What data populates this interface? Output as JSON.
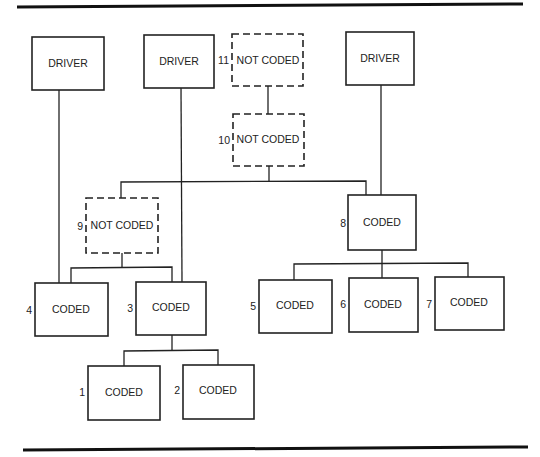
{
  "diagram": {
    "type": "tree",
    "nodes": [
      {
        "id": "driver-1",
        "number": "",
        "label": "DRIVER",
        "style": "solid"
      },
      {
        "id": "driver-2",
        "number": "",
        "label": "DRIVER",
        "style": "solid"
      },
      {
        "id": "driver-3",
        "number": "",
        "label": "DRIVER",
        "style": "solid"
      },
      {
        "id": "n11",
        "number": "11",
        "label": "NOT CODED",
        "style": "dashed"
      },
      {
        "id": "n10",
        "number": "10",
        "label": "NOT CODED",
        "style": "dashed"
      },
      {
        "id": "n9",
        "number": "9",
        "label": "NOT CODED",
        "style": "dashed"
      },
      {
        "id": "n8",
        "number": "8",
        "label": "CODED",
        "style": "solid"
      },
      {
        "id": "n4",
        "number": "4",
        "label": "CODED",
        "style": "solid"
      },
      {
        "id": "n3",
        "number": "3",
        "label": "CODED",
        "style": "solid"
      },
      {
        "id": "n5",
        "number": "5",
        "label": "CODED",
        "style": "solid"
      },
      {
        "id": "n6",
        "number": "6",
        "label": "CODED",
        "style": "solid"
      },
      {
        "id": "n7",
        "number": "7",
        "label": "CODED",
        "style": "solid"
      },
      {
        "id": "n1",
        "number": "1",
        "label": "CODED",
        "style": "solid"
      },
      {
        "id": "n2",
        "number": "2",
        "label": "CODED",
        "style": "solid"
      }
    ],
    "edges": [
      {
        "from": "n11",
        "to": "n10"
      },
      {
        "from": "n10",
        "to": "n9"
      },
      {
        "from": "n10",
        "to": "n8"
      },
      {
        "from": "driver-3",
        "to": "n8"
      },
      {
        "from": "driver-1",
        "to": "n4"
      },
      {
        "from": "driver-2",
        "to": "n3"
      },
      {
        "from": "n9",
        "to": "n4"
      },
      {
        "from": "n9",
        "to": "n3"
      },
      {
        "from": "n8",
        "to": "n5"
      },
      {
        "from": "n8",
        "to": "n6"
      },
      {
        "from": "n8",
        "to": "n7"
      },
      {
        "from": "n3",
        "to": "n1"
      },
      {
        "from": "n3",
        "to": "n2"
      }
    ]
  }
}
